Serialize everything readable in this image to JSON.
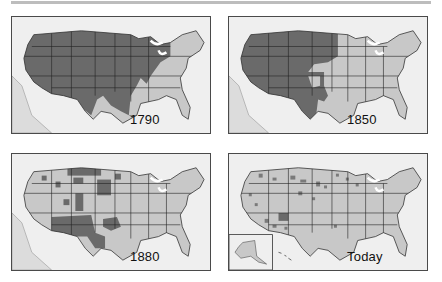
{
  "figure": {
    "colors": {
      "native_land": "#6a6a6a",
      "other_land": "#c8c8c8",
      "water_background": "#efefef",
      "state_borders": "#222222",
      "frame": "#4a4a4a"
    },
    "panels": [
      {
        "id": "p1",
        "label": "1790",
        "position": "top-left"
      },
      {
        "id": "p2",
        "label": "1850",
        "position": "top-right"
      },
      {
        "id": "p3",
        "label": "1880",
        "position": "bottom-left"
      },
      {
        "id": "p4",
        "label": "Today",
        "position": "bottom-right",
        "inset": "Alaska"
      }
    ]
  }
}
